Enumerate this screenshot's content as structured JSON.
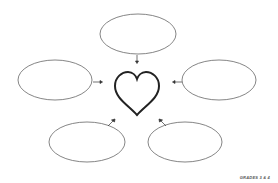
{
  "diagram": {
    "type": "bubble-map",
    "center_icon": "heart-icon",
    "bubbles": [
      {
        "position": "top",
        "text": ""
      },
      {
        "position": "left",
        "text": ""
      },
      {
        "position": "right",
        "text": ""
      },
      {
        "position": "bottom-left",
        "text": ""
      },
      {
        "position": "bottom-right",
        "text": ""
      }
    ],
    "colors": {
      "line": "#555555",
      "heart": "#222222"
    }
  },
  "footer": {
    "grade_label": "GRADES 3 & 4"
  }
}
